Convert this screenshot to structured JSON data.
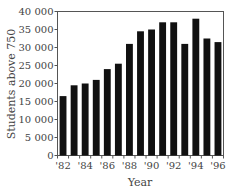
{
  "chart_data": {
    "type": "bar",
    "title": "",
    "xlabel": "Year",
    "ylabel": "Students above 750",
    "ylim": [
      0,
      40000
    ],
    "yticks": [
      0,
      5000,
      10000,
      15000,
      20000,
      25000,
      30000,
      35000,
      40000
    ],
    "ytick_labels": [
      "0",
      "5 000",
      "10 000",
      "15 000",
      "20 000",
      "25 000",
      "30 000",
      "35 000",
      "40 000"
    ],
    "categories": [
      "'82",
      "'83",
      "'84",
      "'85",
      "'86",
      "'87",
      "'88",
      "'89",
      "'90",
      "'91",
      "'92",
      "'93",
      "'94",
      "'95",
      "'96"
    ],
    "xtick_labels_shown": [
      "'82",
      "",
      "'84",
      "",
      "'86",
      "",
      "'88",
      "",
      "'90",
      "",
      "'92",
      "",
      "'94",
      "",
      "'96"
    ],
    "values": [
      16500,
      19500,
      20000,
      21000,
      24000,
      25500,
      31000,
      34500,
      35000,
      37000,
      37000,
      31000,
      38000,
      32500,
      31500
    ],
    "bar_color": "#111111",
    "grid": false,
    "legend": null
  }
}
